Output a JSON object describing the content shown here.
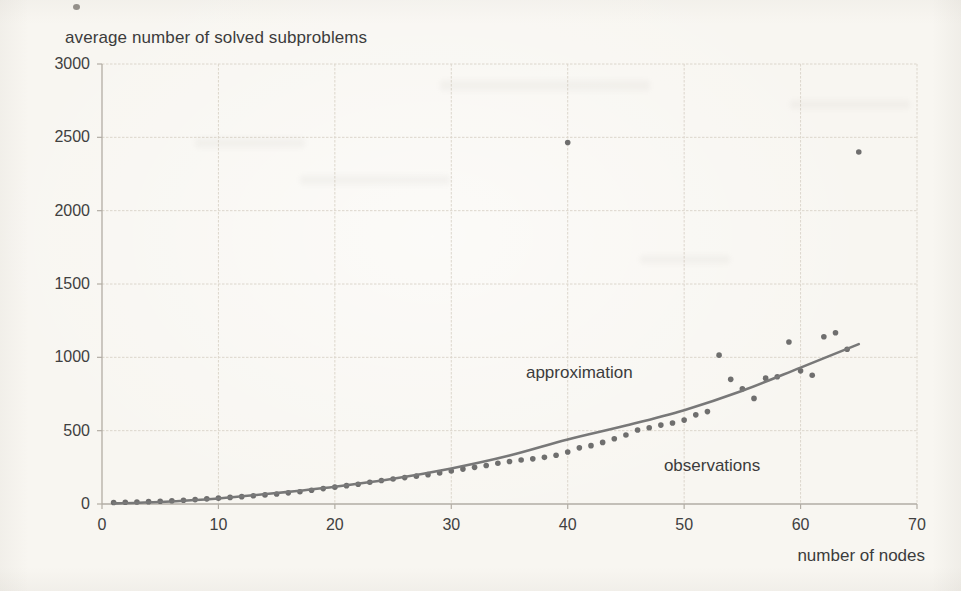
{
  "chart_data": {
    "type": "scatter",
    "title": "average number of solved subproblems",
    "xlabel": "number of nodes",
    "ylabel": "",
    "xlim": [
      0,
      70
    ],
    "ylim": [
      0,
      3000
    ],
    "x_ticks": [
      0,
      10,
      20,
      30,
      40,
      50,
      60,
      70
    ],
    "y_ticks": [
      0,
      500,
      1000,
      1500,
      2000,
      2500,
      3000
    ],
    "grid": true,
    "legend_position": "none",
    "annotations": [
      {
        "label": "approximation",
        "x": 41.0,
        "y": 890
      },
      {
        "label": "observations",
        "x": 52.4,
        "y": 260
      }
    ],
    "series": [
      {
        "name": "observations",
        "type": "scatter",
        "color": "#5f5f5f",
        "points": [
          [
            1,
            10
          ],
          [
            2,
            12
          ],
          [
            3,
            14
          ],
          [
            4,
            16
          ],
          [
            5,
            19
          ],
          [
            6,
            22
          ],
          [
            7,
            26
          ],
          [
            8,
            30
          ],
          [
            9,
            35
          ],
          [
            10,
            40
          ],
          [
            11,
            45
          ],
          [
            12,
            50
          ],
          [
            13,
            56
          ],
          [
            14,
            62
          ],
          [
            15,
            68
          ],
          [
            16,
            76
          ],
          [
            17,
            84
          ],
          [
            18,
            94
          ],
          [
            19,
            105
          ],
          [
            20,
            115
          ],
          [
            21,
            125
          ],
          [
            22,
            135
          ],
          [
            23,
            148
          ],
          [
            24,
            160
          ],
          [
            25,
            170
          ],
          [
            26,
            180
          ],
          [
            27,
            190
          ],
          [
            28,
            200
          ],
          [
            29,
            212
          ],
          [
            30,
            225
          ],
          [
            31,
            238
          ],
          [
            32,
            250
          ],
          [
            33,
            262
          ],
          [
            34,
            278
          ],
          [
            35,
            290
          ],
          [
            36,
            300
          ],
          [
            37,
            308
          ],
          [
            38,
            318
          ],
          [
            39,
            332
          ],
          [
            40,
            355
          ],
          [
            41,
            383
          ],
          [
            42,
            398
          ],
          [
            43,
            420
          ],
          [
            44,
            445
          ],
          [
            45,
            470
          ],
          [
            46,
            505
          ],
          [
            47,
            520
          ],
          [
            48,
            538
          ],
          [
            49,
            552
          ],
          [
            50,
            572
          ],
          [
            51,
            608
          ],
          [
            52,
            630
          ],
          [
            53,
            1015
          ],
          [
            54,
            850
          ],
          [
            55,
            785
          ],
          [
            56,
            720
          ],
          [
            57,
            858
          ],
          [
            58,
            868
          ],
          [
            59,
            1105
          ],
          [
            60,
            908
          ],
          [
            61,
            878
          ],
          [
            62,
            1140
          ],
          [
            63,
            1168
          ],
          [
            64,
            1055
          ],
          [
            40,
            2465
          ],
          [
            65,
            2400
          ]
        ]
      },
      {
        "name": "approximation",
        "type": "line",
        "color": "#787878",
        "points": [
          [
            1,
            4
          ],
          [
            5,
            14
          ],
          [
            10,
            38
          ],
          [
            15,
            75
          ],
          [
            20,
            118
          ],
          [
            25,
            172
          ],
          [
            30,
            242
          ],
          [
            35,
            330
          ],
          [
            40,
            440
          ],
          [
            45,
            535
          ],
          [
            50,
            640
          ],
          [
            55,
            772
          ],
          [
            60,
            930
          ],
          [
            65,
            1090
          ]
        ]
      }
    ]
  }
}
